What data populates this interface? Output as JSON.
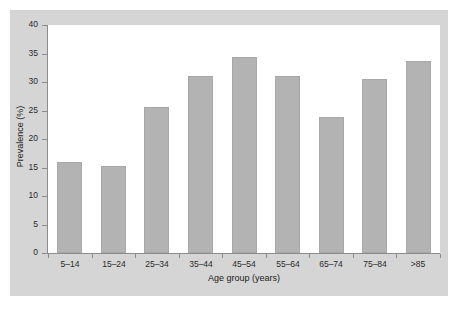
{
  "chart_data": {
    "type": "bar",
    "title": "",
    "subtitle": "",
    "xlabel": "Age group (years)",
    "ylabel": "Prevalence (%)",
    "categories": [
      "5–14",
      "15–24",
      "25–34",
      "35–44",
      "45–54",
      "55–64",
      "65–74",
      "75–84",
      ">85"
    ],
    "values": [
      16.0,
      15.3,
      25.6,
      31.0,
      34.3,
      31.0,
      23.9,
      30.6,
      33.6
    ],
    "ylim": [
      0,
      40
    ],
    "ytick_labels": [
      "0",
      "5",
      "10",
      "15",
      "20",
      "25",
      "30",
      "35",
      "40"
    ],
    "ytick_values": [
      0,
      5,
      10,
      15,
      20,
      25,
      30,
      35,
      40
    ],
    "grid": false,
    "legend": false,
    "legend_position": "none",
    "bar_color": "#b3b3b3",
    "bar_edge_color": "#a8a8a8",
    "axis_color": "#8c8c8c",
    "plot_background": "#ffffff",
    "panel_background": "#d5d5d5",
    "figure_background": "#ffffff",
    "text_color": "#1c1c1c"
  }
}
